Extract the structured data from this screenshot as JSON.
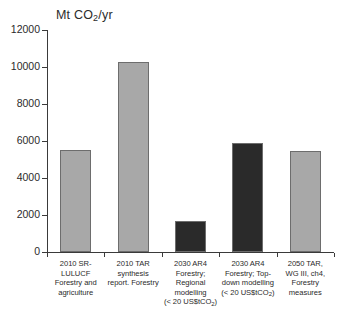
{
  "chart_data": {
    "type": "bar",
    "title": "Mt CO2/yr",
    "title_parts": {
      "prefix": "Mt CO",
      "sub": "2",
      "suffix": "/yr"
    },
    "xlabel": "",
    "ylabel": "",
    "ylim": [
      0,
      12000
    ],
    "ytick_labels": [
      "0",
      "2000",
      "4000",
      "6000",
      "8000",
      "10000",
      "12000"
    ],
    "ytick_values": [
      0,
      2000,
      4000,
      6000,
      8000,
      10000,
      12000
    ],
    "grid": false,
    "legend": "none",
    "categories": [
      "2010 SR-LULUCF Forestry and agriculture",
      "2010 TAR synthesis report. Forestry",
      "2030 AR4 Forestry; Regional modelling (< 20 US$tCO2)",
      "2030 AR4 Forestry; Top-down modelling (< 20 US$tCO2)",
      "2050 TAR, WG III, ch4, Forestry measures"
    ],
    "values": [
      5500,
      10250,
      1650,
      5900,
      5450
    ],
    "bar_colors": [
      "#a8a8a8",
      "#a8a8a8",
      "#2a2a2a",
      "#2a2a2a",
      "#a8a8a8"
    ],
    "category_lines": [
      [
        "2010  SR-",
        "LULUCF",
        "Forestry and",
        "agriculture"
      ],
      [
        "2010  TAR",
        "synthesis",
        "report. Forestry"
      ],
      [
        "2030  AR4",
        "Forestry;",
        "Regional",
        "modelling",
        "(< 20 US$tCO2)"
      ],
      [
        "2030  AR4",
        "Forestry; Top-",
        "down modelling",
        "(< 20 US$tCO2)"
      ],
      [
        "2050  TAR,",
        "WG III, ch4,",
        "Forestry",
        "measures"
      ]
    ]
  },
  "colors": {
    "axis": "#3a3a3a",
    "text": "#2b2b2b",
    "bar_light": "#a8a8a8",
    "bar_dark": "#2a2a2a",
    "bar_border": "#6d6d6d",
    "background": "#ffffff"
  }
}
